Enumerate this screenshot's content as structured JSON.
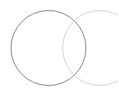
{
  "diagram": {
    "type": "venn",
    "background": "#ffffff",
    "circles": [
      {
        "name": "left",
        "cx": 48.5,
        "cy": 48,
        "r": 37.5,
        "stroke": "#8c8c8c",
        "stroke_width": 1
      },
      {
        "name": "right",
        "cx": 100,
        "cy": 48,
        "r": 37.5,
        "stroke": "#d4d4d4",
        "stroke_width": 1
      }
    ]
  }
}
